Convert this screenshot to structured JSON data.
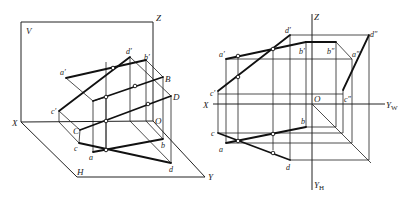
{
  "figure": {
    "left_view": {
      "type": "axonometric-three-plane",
      "planes": {
        "V": "V",
        "H": "H"
      },
      "axes": {
        "X": "X",
        "Y": "Y",
        "Z": "Z",
        "O": "O"
      },
      "points_v_projection": {
        "a": "a′",
        "b": "b′",
        "c": "c′",
        "d": "d′"
      },
      "points_space": {
        "B": "B",
        "C": "C",
        "D": "D"
      },
      "points_h_projection": {
        "a": "a",
        "b": "b",
        "c": "c",
        "d": "d"
      }
    },
    "right_view": {
      "type": "orthographic-three-view",
      "axes": {
        "X": "X",
        "Z": "Z",
        "O": "O",
        "YW": "Y",
        "YW_sub": "W",
        "YH": "Y",
        "YH_sub": "H"
      },
      "points_v_projection": {
        "a": "a′",
        "b": "b′",
        "c": "c′",
        "d": "d′"
      },
      "points_w_projection": {
        "a": "a″",
        "b": "b″",
        "c": "c″",
        "d": "d″"
      },
      "points_h_projection": {
        "a": "a",
        "b": "b",
        "c": "c",
        "d": "d"
      }
    }
  }
}
